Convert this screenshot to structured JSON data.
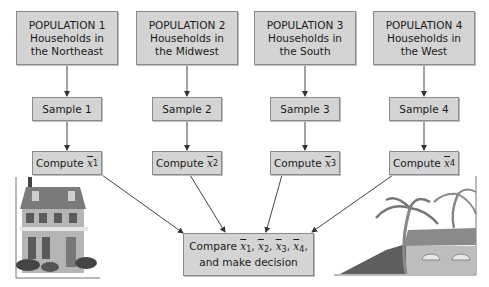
{
  "populations": [
    {
      "title": "POPULATION 1",
      "line1": "Households in",
      "line2": "the Northeast"
    },
    {
      "title": "POPULATION 2",
      "line1": "Households in",
      "line2": "the Midwest"
    },
    {
      "title": "POPULATION 3",
      "line1": "Households in",
      "line2": "the South"
    },
    {
      "title": "POPULATION 4",
      "line1": "Households in",
      "line2": "the West"
    }
  ],
  "samples": [
    "Sample 1",
    "Sample 2",
    "Sample 3",
    "Sample 4"
  ],
  "compute": {
    "label": "Compute",
    "var": "x",
    "subs": [
      "1",
      "2",
      "3",
      "4"
    ]
  },
  "compare": {
    "label": "Compare",
    "var": "x",
    "subs": [
      "1",
      "2",
      "3",
      "4"
    ],
    "line2": "and make decision"
  },
  "illustrations": {
    "left": "house-illustration",
    "right": "palm-trees-house-illustration"
  },
  "colors": {
    "box_fill": "#d4d4d4",
    "box_border": "#8a8a8a",
    "arrow": "#333333"
  }
}
